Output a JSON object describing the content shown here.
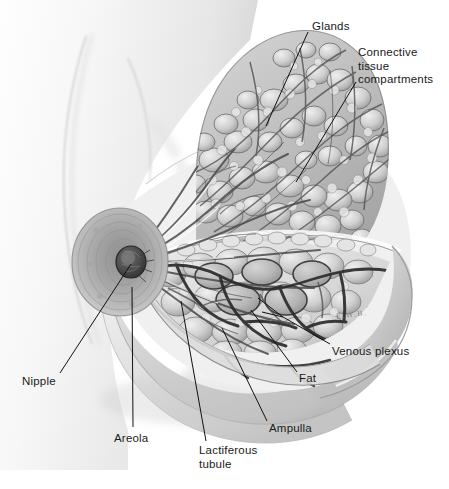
{
  "figure": {
    "background_color": "#ffffff",
    "width": 449,
    "height": 489,
    "signature": "E.W.B."
  },
  "labels": [
    {
      "id": "glands",
      "text": "Glands",
      "x": 312,
      "y": 20,
      "line": [
        308,
        32,
        266,
        126
      ]
    },
    {
      "id": "connective",
      "text": "Connective\ntissue\ncompartments",
      "x": 358,
      "y": 46,
      "line": [
        356,
        82,
        296,
        182
      ]
    },
    {
      "id": "venous",
      "text": "Venous plexus",
      "x": 332,
      "y": 345,
      "line": [
        330,
        344,
        283,
        317
      ]
    },
    {
      "id": "fat",
      "text": "Fat",
      "x": 299,
      "y": 372,
      "line": [
        297,
        372,
        251,
        310
      ]
    },
    {
      "id": "ampulla",
      "text": "Ampulla",
      "x": 269,
      "y": 422,
      "line": [
        267,
        421,
        222,
        328
      ]
    },
    {
      "id": "lactiferous",
      "text": "Lactiferous\ntubule",
      "x": 199,
      "y": 444,
      "line": [
        206,
        441,
        181,
        301
      ]
    },
    {
      "id": "areola",
      "text": "Areola",
      "x": 114,
      "y": 432,
      "line": [
        133,
        427,
        132,
        287
      ]
    },
    {
      "id": "nipple",
      "text": "Nipple",
      "x": 22,
      "y": 375,
      "line": [
        60,
        373,
        131,
        264
      ]
    }
  ],
  "structures": {
    "torso": "chest wall and shoulder silhouette",
    "breast_outline": "breast contour in profile",
    "glandular_tissue": "lobulated mammary gland tissue",
    "fat_lobules": "adipose lobules with ampullae",
    "venous_plexus": "dark branching subcutaneous veins",
    "nipple": "central nipple protrusion",
    "areola": "pigmented areolar disc",
    "lactiferous_ducts": "ducts radiating to the nipple",
    "cut_plane": "sectioned cut-away face"
  },
  "colors": {
    "ink": "#1a1a1a",
    "skin_light": "#f4f4f4",
    "skin_shade": "#c9c9c9",
    "tissue_mid": "#b4b4b4",
    "tissue_dark": "#5d5d5d",
    "vein": "#3a3a3a",
    "background": "#ffffff"
  }
}
